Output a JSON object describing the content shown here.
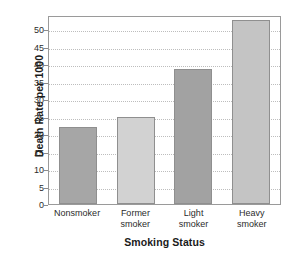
{
  "chart_data": {
    "type": "bar",
    "title": "",
    "subtitle": "",
    "xlabel": "Smoking Status",
    "ylabel": "Death Rate per 1000",
    "categories": [
      "Nonsmoker",
      "Former smoker",
      "Light smoker",
      "Heavy smoker"
    ],
    "category_lines": [
      [
        "Nonsmoker",
        ""
      ],
      [
        "Former",
        "smoker"
      ],
      [
        "Light",
        "smoker"
      ],
      [
        "Heavy",
        "smoker"
      ]
    ],
    "values": [
      22,
      25,
      38.5,
      52.5
    ],
    "bar_colors": [
      "#a6a6a6",
      "#d2d2d2",
      "#a2a2a2",
      "#c4c4c4"
    ],
    "ylim": [
      0,
      54
    ],
    "yticks": [
      0,
      5,
      10,
      15,
      20,
      25,
      30,
      35,
      40,
      45,
      50
    ],
    "ytick_labels": [
      "0",
      "5",
      "10",
      "15",
      "20",
      "25",
      "30",
      "35",
      "40",
      "45",
      "50"
    ],
    "grid": "horizontal-dotted",
    "legend": "none",
    "annotations": []
  },
  "style": {
    "frame_color": "#9a9a9a",
    "grid_color": "#bdbdbd",
    "text_color": "#1a1a1a",
    "background": "#ffffff"
  }
}
